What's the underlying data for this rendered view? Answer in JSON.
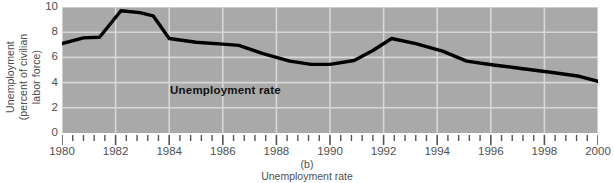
{
  "figure": {
    "panel_letter": "(b)",
    "caption": "Unemployment rate",
    "y_axis_title_lines": [
      "Unemployment",
      "(percent of civilian",
      "labor force)"
    ],
    "series_annotation": "Unemployment rate",
    "colors": {
      "plot_background": "#a9a9a9",
      "gridline": "#d7d7d7",
      "series_line": "#000000",
      "text": "#4f4f4f",
      "page_background": "#ffffff"
    }
  },
  "chart_data": {
    "type": "line",
    "title": "",
    "subtitle": "",
    "xlabel": "Unemployment rate",
    "ylabel": "Unemployment (percent of civilian labor force)",
    "xlim": [
      1980,
      2000
    ],
    "ylim": [
      0,
      10
    ],
    "grid": true,
    "legend_position": "inline-annotation",
    "x_tick_labels": [
      "1980",
      "1982",
      "1984",
      "1986",
      "1988",
      "1990",
      "1992",
      "1994",
      "1996",
      "1998",
      "2000"
    ],
    "x_tick_values": [
      1980,
      1982,
      1984,
      1986,
      1988,
      1990,
      1992,
      1994,
      1996,
      1998,
      2000
    ],
    "x_minor_ticks_per_interval": 4,
    "y_tick_labels": [
      "0",
      "2",
      "4",
      "6",
      "8",
      "10"
    ],
    "y_tick_values": [
      0,
      2,
      4,
      6,
      8,
      10
    ],
    "annotations": [
      {
        "text": "Unemployment rate",
        "x": 1986.1,
        "y": 3.35,
        "bold": true
      }
    ],
    "series": [
      {
        "name": "Unemployment rate",
        "color": "#000000",
        "line_width": 3.4,
        "x": [
          1980.0,
          1980.8,
          1981.4,
          1982.2,
          1982.9,
          1983.4,
          1984.0,
          1985.0,
          1986.0,
          1986.6,
          1987.5,
          1988.5,
          1989.3,
          1990.0,
          1990.9,
          1991.6,
          1992.3,
          1993.2,
          1994.2,
          1995.1,
          1996.1,
          1997.2,
          1998.3,
          1999.3,
          2000.0
        ],
        "y": [
          7.1,
          7.55,
          7.6,
          9.7,
          9.55,
          9.3,
          7.5,
          7.2,
          7.05,
          6.95,
          6.3,
          5.7,
          5.45,
          5.45,
          5.75,
          6.55,
          7.5,
          7.1,
          6.5,
          5.7,
          5.4,
          5.1,
          4.8,
          4.5,
          4.1
        ],
        "annual_values": {
          "1980": 7.1,
          "1981": 7.6,
          "1982": 9.7,
          "1983": 9.6,
          "1984": 7.5,
          "1985": 7.2,
          "1986": 7.0,
          "1987": 6.2,
          "1988": 5.5,
          "1989": 5.3,
          "1990": 5.6,
          "1991": 6.8,
          "1992": 7.5,
          "1993": 6.9,
          "1994": 6.1,
          "1995": 5.6,
          "1996": 5.4,
          "1997": 4.9,
          "1998": 4.5,
          "1999": 4.2,
          "2000": 4.0
        }
      }
    ]
  }
}
